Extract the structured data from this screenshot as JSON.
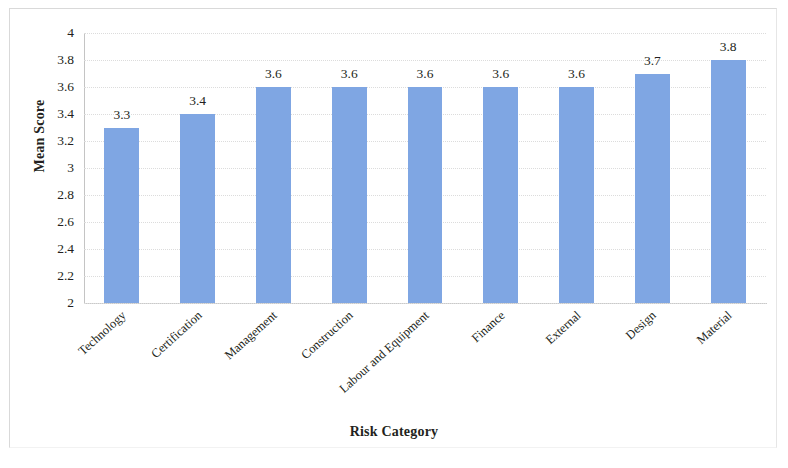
{
  "chart_data": {
    "type": "bar",
    "title": "",
    "xlabel": "Risk Category",
    "ylabel": "Mean Score",
    "categories": [
      "Technology",
      "Certification",
      "Management",
      "Construction",
      "Labour and Equipment",
      "Finance",
      "External",
      "Design",
      "Material"
    ],
    "values": [
      3.3,
      3.4,
      3.6,
      3.6,
      3.6,
      3.6,
      3.6,
      3.7,
      3.8
    ],
    "value_labels": [
      "3.3",
      "3.4",
      "3.6",
      "3.6",
      "3.6",
      "3.6",
      "3.6",
      "3.7",
      "3.8"
    ],
    "ylim": [
      2,
      4
    ],
    "ytick_labels": [
      "4",
      "3.8",
      "3.6",
      "3.4",
      "3.2",
      "3",
      "2.8",
      "2.6",
      "2.4",
      "2.2",
      "2"
    ],
    "ytick_values": [
      4,
      3.8,
      3.6,
      3.4,
      3.2,
      3,
      2.8,
      2.6,
      2.4,
      2.2,
      2
    ],
    "grid": true,
    "legend": "none",
    "bar_color": "#7fa6e3",
    "text_color": "#231f20",
    "gridline_color": "#dcdcdc"
  }
}
